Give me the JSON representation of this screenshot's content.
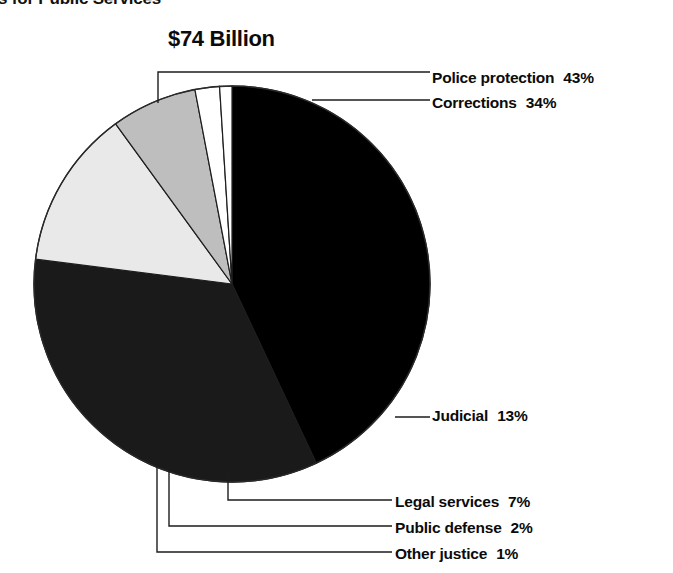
{
  "heading": {
    "clipped_title": "s for Public Services"
  },
  "chart_data": {
    "type": "pie",
    "title": "$74 Billion",
    "subtitle": "s for Public Services",
    "total_label": "$74 Billion",
    "xlabel": "",
    "ylabel": "",
    "units": "percent",
    "categories": [
      "Police protection",
      "Corrections",
      "Judicial",
      "Legal services",
      "Public defense",
      "Other justice"
    ],
    "values": [
      43,
      34,
      13,
      7,
      2,
      1
    ],
    "value_labels": [
      "43%",
      "34%",
      "13%",
      "7%",
      "2%",
      "1%"
    ],
    "colors": [
      "#000000",
      "#1a1a1a",
      "#e9e9e9",
      "#bebebe",
      "#ffffff",
      "#ffffff"
    ],
    "legend_position": "callout-lines",
    "grid": false,
    "start_angle_deg": 0,
    "direction": "clockwise",
    "slices": [
      {
        "name": "Police protection",
        "value": 43,
        "label": "Police protection",
        "pct_text": "43%",
        "color": "#000000"
      },
      {
        "name": "Corrections",
        "value": 34,
        "label": "Corrections",
        "pct_text": "34%",
        "color": "#1a1a1a"
      },
      {
        "name": "Judicial",
        "value": 13,
        "label": "Judicial",
        "pct_text": "13%",
        "color": "#e9e9e9"
      },
      {
        "name": "Legal services",
        "value": 7,
        "label": "Legal services",
        "pct_text": "7%",
        "color": "#bebebe"
      },
      {
        "name": "Public defense",
        "value": 2,
        "label": "Public defense",
        "pct_text": "2%",
        "color": "#ffffff"
      },
      {
        "name": "Other justice",
        "value": 1,
        "label": "Other justice",
        "pct_text": "1%",
        "color": "#ffffff"
      }
    ]
  },
  "callouts": {
    "police": {
      "label": "Police protection",
      "pct": "43%"
    },
    "corrections": {
      "label": "Corrections",
      "pct": "34%"
    },
    "judicial": {
      "label": "Judicial",
      "pct": "13%"
    },
    "legal": {
      "label": "Legal services",
      "pct": "7%"
    },
    "public_defense": {
      "label": "Public defense",
      "pct": "2%"
    },
    "other": {
      "label": "Other justice",
      "pct": "1%"
    }
  }
}
